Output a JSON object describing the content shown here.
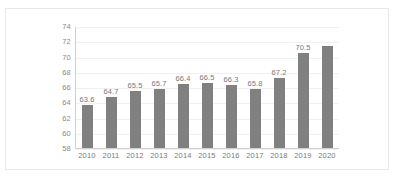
{
  "chart_data": {
    "type": "bar",
    "title": "",
    "subtitle": "",
    "xlabel": "",
    "ylabel": "",
    "categories": [
      "2010",
      "2011",
      "2012",
      "2013",
      "2014",
      "2015",
      "2016",
      "2017",
      "2018",
      "2019",
      "2020"
    ],
    "values": [
      63.6,
      64.7,
      65.5,
      65.7,
      66.4,
      66.5,
      66.3,
      65.8,
      67.2,
      70.5,
      71.4
    ],
    "data_labels": [
      "63.6",
      "64.7",
      "65.5",
      "65.7",
      "66.4",
      "66.5",
      "66.3",
      "65.8",
      "67.2",
      "70.5",
      ""
    ],
    "ylim": [
      58,
      74
    ],
    "ytick_step": 2,
    "yticks": [
      "58",
      "60",
      "62",
      "64",
      "66",
      "68",
      "70",
      "72",
      "74"
    ],
    "grid": true,
    "legend": false,
    "legend_position": "none",
    "bar_color": "#808080",
    "gridline_color": "#f1f1f1",
    "axis_color": "#d0d0d0",
    "label_color": "#7a7a7a",
    "plot_background": "#ffffff",
    "border_color": "#e8e8e8"
  }
}
